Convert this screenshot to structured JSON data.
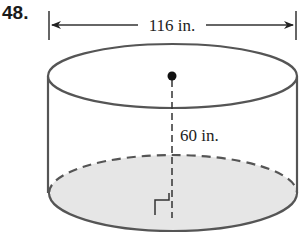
{
  "problem": {
    "number": "48."
  },
  "diagram": {
    "shape": "cylinder",
    "diameter_label": "116 in.",
    "height_label": "60 in.",
    "colors": {
      "stroke": "#555555",
      "base_fill": "#e6e6e6",
      "dot": "#111111"
    }
  }
}
